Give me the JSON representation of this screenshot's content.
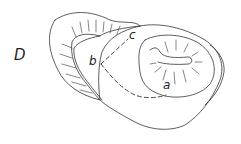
{
  "figure": {
    "panel_label": "D",
    "points": {
      "a": "a",
      "b": "b",
      "c": "c"
    },
    "line_color": "#333333",
    "background": "#ffffff"
  }
}
